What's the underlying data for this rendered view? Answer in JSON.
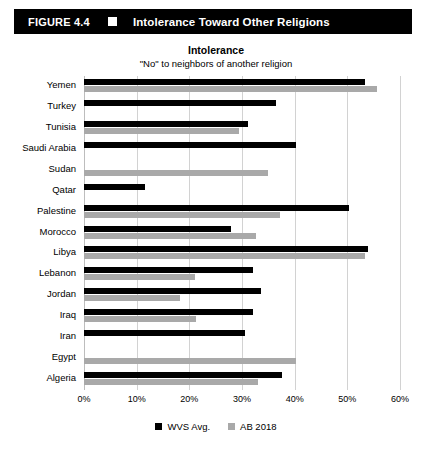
{
  "header": {
    "figure_number": "FIGURE 4.4",
    "bullet_icon": "square-icon",
    "title": "Intolerance Toward Other Religions"
  },
  "chart_data": {
    "type": "bar",
    "orientation": "horizontal",
    "title": "Intolerance",
    "subtitle": "\"No\" to neighbors of another religion",
    "xlabel": "",
    "ylabel": "",
    "xlim": [
      0,
      60
    ],
    "xticks": [
      "0%",
      "10%",
      "20%",
      "30%",
      "40%",
      "50%",
      "60%"
    ],
    "xtick_values": [
      0,
      10,
      20,
      30,
      40,
      50,
      60
    ],
    "grid": true,
    "legend_position": "bottom",
    "categories": [
      "Yemen",
      "Turkey",
      "Tunisia",
      "Saudi Arabia",
      "Sudan",
      "Qatar",
      "Palestine",
      "Morocco",
      "Libya",
      "Lebanon",
      "Jordan",
      "Iraq",
      "Iran",
      "Egypt",
      "Algeria"
    ],
    "series": [
      {
        "name": "WVS Avg.",
        "color": "#000000",
        "values": [
          53.3,
          36.5,
          31.2,
          40.2,
          null,
          11.6,
          50.3,
          28.0,
          54.0,
          32.0,
          33.6,
          32.0,
          30.6,
          null,
          37.5
        ]
      },
      {
        "name": "AB 2018",
        "color": "#a9a9a9",
        "values": [
          55.6,
          null,
          29.4,
          null,
          34.9,
          null,
          37.2,
          32.6,
          53.4,
          21.0,
          18.2,
          21.2,
          null,
          40.3,
          33.0
        ]
      }
    ],
    "legend": [
      "WVS Avg.",
      "AB 2018"
    ]
  }
}
